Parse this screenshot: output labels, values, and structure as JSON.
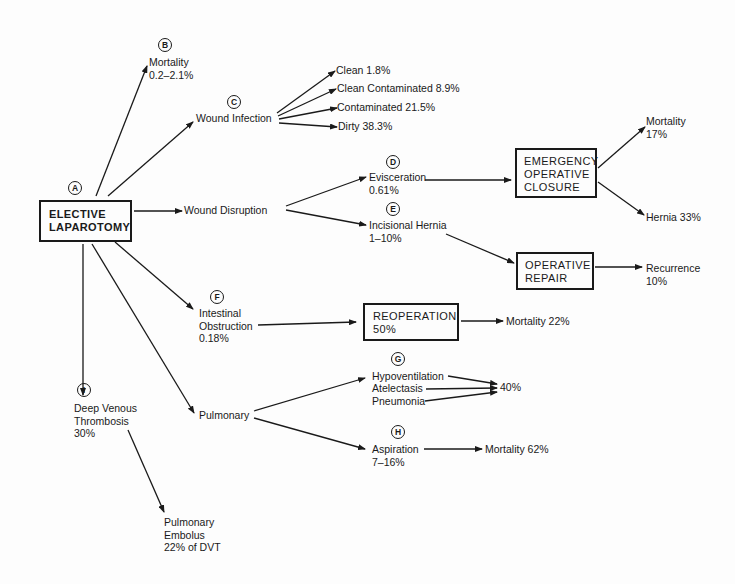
{
  "diagram": {
    "root": {
      "badge": "A",
      "line1": "ELECTIVE",
      "line2": "LAPAROTOMY"
    },
    "mortality": {
      "badge": "B",
      "line1": "Mortality",
      "line2": "0.2–2.1%"
    },
    "wound_infection": {
      "badge": "C",
      "label": "Wound Infection",
      "outcomes": [
        {
          "label": "Clean 1.8%"
        },
        {
          "label": "Clean Contaminated 8.9%"
        },
        {
          "label": "Contaminated 21.5%"
        },
        {
          "label": "Dirty 38.3%"
        }
      ]
    },
    "wound_disruption": {
      "label": "Wound Disruption",
      "evisceration": {
        "badge": "D",
        "line1": "Evisceration",
        "line2": "0.61%"
      },
      "incisional_hernia": {
        "badge": "E",
        "line1": "Incisional Hernia",
        "line2": "1–10%"
      },
      "emergency_closure": {
        "line1": "EMERGENCY",
        "line2": "OPERATIVE",
        "line3": "CLOSURE",
        "mortality_line1": "Mortality",
        "mortality_line2": "17%",
        "hernia": "Hernia 33%"
      },
      "operative_repair": {
        "line1": "OPERATIVE",
        "line2": "REPAIR",
        "recurrence_line1": "Recurrence",
        "recurrence_line2": "10%"
      }
    },
    "intestinal_obstruction": {
      "badge": "F",
      "line1": "Intestinal",
      "line2": "Obstruction",
      "line3": "0.18%",
      "reoperation": {
        "line1": "REOPERATION",
        "line2": "50%"
      },
      "mortality": "Mortality 22%"
    },
    "pulmonary": {
      "label": "Pulmonary",
      "group_g": {
        "badge": "G",
        "items": [
          {
            "label": "Hypoventilation"
          },
          {
            "label": "Atelectasis"
          },
          {
            "label": "Pneumonia"
          }
        ],
        "rate": "40%"
      },
      "aspiration": {
        "badge": "H",
        "line1": "Aspiration",
        "line2": "7–16%",
        "mortality": "Mortality 62%"
      }
    },
    "dvt": {
      "badge": "I",
      "line1": "Deep Venous",
      "line2": "Thrombosis",
      "line3": "30%",
      "embolus": {
        "line1": "Pulmonary",
        "line2": "Embolus",
        "line3": "22% of DVT"
      }
    }
  },
  "colors": {
    "ink": "#1a1a1a",
    "background": "#fdfdfd"
  }
}
